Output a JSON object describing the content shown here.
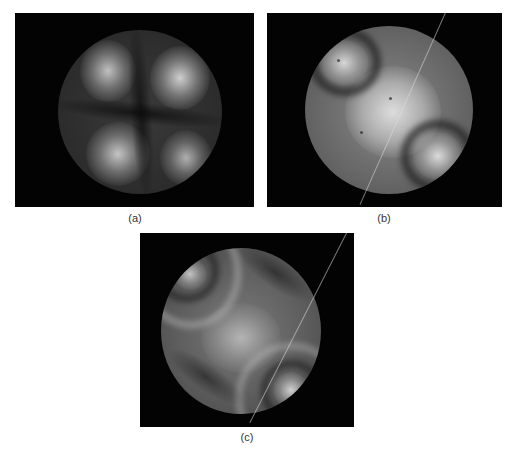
{
  "figure": {
    "panels": [
      {
        "id": "a",
        "label": "(a)",
        "description": "Interference fringe pattern: four bright lobes separated by dark cross-shaped fringes"
      },
      {
        "id": "b",
        "label": "(b)",
        "description": "Interference fringe pattern: bright central saddle region with two bright lobes at upper-left and lower-right, curved dark fringes"
      },
      {
        "id": "c",
        "label": "(c)",
        "description": "Interference fringe pattern: star-like central bright region with multiple curved fringes, small bright lobes at upper-left and lower-right"
      }
    ],
    "colors": {
      "background": "#ffffff",
      "panel_background": "#030303",
      "fringe_bright": "#d8d8d8",
      "fringe_dark": "#1a1a1a"
    }
  }
}
